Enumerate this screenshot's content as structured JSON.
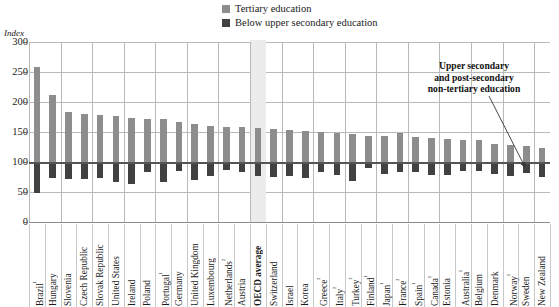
{
  "legend": {
    "items": [
      {
        "label": "Tertiary education",
        "color": "#8d8d8d",
        "key": "tertiary"
      },
      {
        "label": "Below upper secondary education",
        "color": "#414141",
        "key": "below_upper_secondary"
      }
    ]
  },
  "annotation": {
    "line1": "Upper secondary",
    "line2": "and post-secondary",
    "line3": "non-tertiary education"
  },
  "axis": {
    "unit_label": "Index",
    "y_ticks": [
      "0",
      "50",
      "100",
      "150",
      "200",
      "250",
      "300"
    ]
  },
  "chart_data": {
    "type": "bar",
    "title": "",
    "xlabel": "",
    "ylabel": "Index",
    "ylim": [
      0,
      300
    ],
    "yticks": [
      0,
      50,
      100,
      150,
      200,
      250,
      300
    ],
    "grid": true,
    "legend_position": "top-right",
    "baseline": 100,
    "baseline_note": "Upper secondary and post-secondary non-tertiary education = 100",
    "highlight_category": "OECD average",
    "categories": [
      "Brazil¹",
      "Hungary",
      "Slovenia",
      "Czech Republic",
      "Slovak Republic",
      "United States",
      "Ireland",
      "Poland",
      "Portugal¹",
      "Germany",
      "United Kingdom",
      "Luxembourg",
      "Netherlands²",
      "Austria",
      "OECD average",
      "Switzerland",
      "Israel",
      "Korea",
      "Greece²",
      "Italy²",
      "Turkey²",
      "Finland¹",
      "Japan¹",
      "France²",
      "Spain¹",
      "Canada¹",
      "Estonia",
      "Australia¹",
      "Belgium",
      "Denmark",
      "Norway¹",
      "Sweden",
      "New Zealand"
    ],
    "series": [
      {
        "name": "Tertiary education",
        "color": "#8d8d8d",
        "values": [
          258,
          211,
          183,
          180,
          179,
          177,
          174,
          172,
          171,
          167,
          163,
          160,
          159,
          158,
          157,
          155,
          153,
          151,
          150,
          148,
          146,
          144,
          143,
          148,
          141,
          140,
          139,
          137,
          136,
          130,
          129,
          127,
          124
        ]
      },
      {
        "name": "Below upper secondary education",
        "color": "#414141",
        "values": [
          48,
          73,
          72,
          72,
          73,
          66,
          64,
          84,
          67,
          85,
          70,
          77,
          86,
          83,
          77,
          75,
          77,
          73,
          83,
          79,
          68,
          90,
          80,
          84,
          83,
          79,
          78,
          85,
          85,
          80,
          77,
          82,
          75
        ]
      }
    ]
  }
}
